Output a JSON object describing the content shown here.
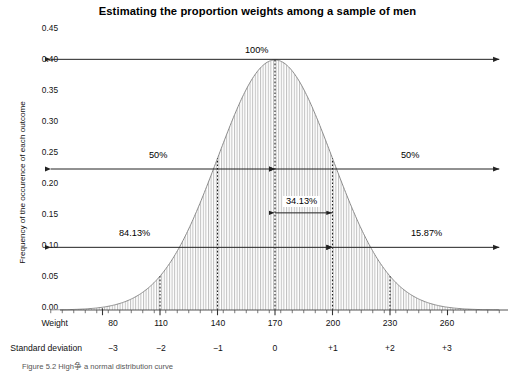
{
  "figure": {
    "title": "Estimating the proportion weights among a sample of men",
    "caption": "Figure 5.2  High争 a normal distribution curve"
  },
  "chart_data": {
    "type": "area",
    "title": "Estimating the proportion weights among a sample of men",
    "xlabel": "Weight",
    "ylabel": "Frequency of the occurence of each outcome",
    "distribution": "normal",
    "mean": 170,
    "std_dev": 30,
    "peak_density": 0.399,
    "ylim": [
      0.0,
      0.45
    ],
    "xlim_sd": [
      -3.9,
      3.9
    ],
    "grid": false,
    "legend": false,
    "yticks": [
      "0.00",
      "0.05",
      "0.10",
      "0.15",
      "0.20",
      "0.25",
      "0.30",
      "0.35",
      "0.40",
      "0.45"
    ],
    "ytick_values": [
      0.0,
      0.05,
      0.1,
      0.15,
      0.2,
      0.25,
      0.3,
      0.35,
      0.4,
      0.45
    ],
    "axis_rows": [
      {
        "label": "Weight",
        "ticks": [
          "80",
          "110",
          "140",
          "170",
          "200",
          "230",
          "260"
        ]
      },
      {
        "label": "Standard deviation",
        "ticks": [
          "−3",
          "−2",
          "−1",
          "0",
          "+1",
          "+2",
          "+3"
        ]
      }
    ],
    "sd_positions": [
      -3,
      -2,
      -1,
      0,
      1,
      2,
      3
    ],
    "dotted_sd_lines": [
      -3,
      -2,
      -1,
      0,
      1,
      2
    ],
    "annotations": [
      {
        "label": "100%",
        "from_sd": -3.9,
        "to_sd": 3.9,
        "y_value": 0.4,
        "arrow": "both"
      },
      {
        "label": "50%",
        "from_sd": -3.9,
        "to_sd": 0,
        "y_value": 0.225,
        "arrow": "both"
      },
      {
        "label": "50%",
        "from_sd": 0,
        "to_sd": 3.9,
        "y_value": 0.225,
        "arrow": "both"
      },
      {
        "label": "34.13%",
        "from_sd": 0,
        "to_sd": 1,
        "y_value": 0.155,
        "arrow": "both"
      },
      {
        "label": "84.13%",
        "from_sd": -3.9,
        "to_sd": 1,
        "y_value": 0.1,
        "arrow": "both"
      },
      {
        "label": "15.87%",
        "from_sd": 1,
        "to_sd": 3.9,
        "y_value": 0.1,
        "arrow": "both"
      }
    ],
    "colors": {
      "curve": "#8c8c8c",
      "fill_hatch": "#bfbfbf",
      "axis": "#555555",
      "annotation": "#222222",
      "text": "#111111"
    }
  }
}
